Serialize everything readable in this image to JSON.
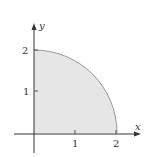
{
  "diagram": {
    "type": "quarter-circle-region",
    "axes": {
      "x_label": "x",
      "y_label": "y",
      "x_ticks": [
        "1",
        "2"
      ],
      "y_ticks": [
        "1",
        "2"
      ]
    },
    "region": {
      "radius": 2,
      "fill_color": "#e6e6e6",
      "stroke_color": "#999999"
    },
    "axis_color": "#333333"
  }
}
